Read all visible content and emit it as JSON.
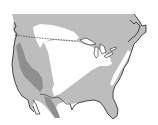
{
  "map": {
    "title": "North America range map",
    "region": "United States and southern Canada",
    "colors": {
      "background": "#ffffff",
      "light_range": "#bdbdbd",
      "dark_range": "#8f8f8f",
      "excluded": "#ffffff",
      "coastline": "#222222",
      "border_line": "#333333"
    },
    "layers": [
      {
        "name": "light-gray-range",
        "description": "Light gray shaded area covering most of the continent"
      },
      {
        "name": "dark-gray-band",
        "description": "Darker band along the western mountain ranges"
      },
      {
        "name": "white-interior",
        "description": "Unshaded white interior region (Great Plains / Midwest)"
      },
      {
        "name": "white-northern",
        "description": "Unshaded white area in the Canadian prairies"
      },
      {
        "name": "white-appalachian-stripe",
        "description": "Narrow white stripe along the Appalachians"
      }
    ],
    "features": {
      "border_line": "dashed US-Canada border (49th parallel)",
      "great_lakes": "Great Lakes outlined",
      "mexico_border": "solid US-Mexico border line"
    },
    "legend": null
  }
}
